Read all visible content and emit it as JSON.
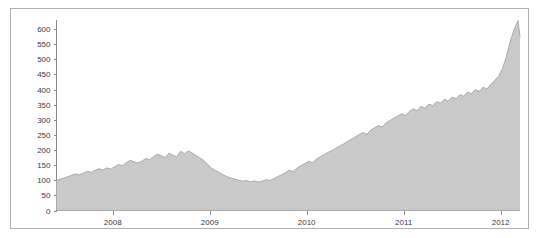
{
  "chart_data": {
    "type": "area",
    "title": "",
    "subtitle": "",
    "xlabel": "",
    "ylabel": "",
    "xlim": [
      2007.42,
      2012.2
    ],
    "ylim": [
      0,
      630
    ],
    "grid": false,
    "legend": null,
    "series_color": "#c9c9c9",
    "line_color": "#9d9d9d",
    "axis_color": "#8a8a8a",
    "border_color": "#b0b0b0",
    "yticks": [
      0,
      50,
      100,
      150,
      200,
      250,
      300,
      350,
      400,
      450,
      500,
      550,
      600
    ],
    "ytick_labels": [
      "0",
      "50",
      "100",
      "150",
      "200",
      "250",
      "300",
      "350",
      "400",
      "450",
      "500",
      "550",
      "600"
    ],
    "xticks": [
      2008,
      2009,
      2010,
      2011,
      2012
    ],
    "xtick_labels": [
      "2008",
      "2009",
      "2010",
      "2011",
      "2012"
    ],
    "x": [
      2007.42,
      2007.46,
      2007.5,
      2007.54,
      2007.58,
      2007.62,
      2007.66,
      2007.7,
      2007.74,
      2007.78,
      2007.82,
      2007.86,
      2007.9,
      2007.94,
      2007.98,
      2008.02,
      2008.06,
      2008.1,
      2008.14,
      2008.18,
      2008.22,
      2008.26,
      2008.3,
      2008.34,
      2008.38,
      2008.42,
      2008.46,
      2008.5,
      2008.54,
      2008.58,
      2008.62,
      2008.66,
      2008.7,
      2008.74,
      2008.78,
      2008.82,
      2008.86,
      2008.9,
      2008.94,
      2008.98,
      2009.02,
      2009.06,
      2009.1,
      2009.14,
      2009.18,
      2009.22,
      2009.26,
      2009.3,
      2009.34,
      2009.38,
      2009.42,
      2009.46,
      2009.5,
      2009.54,
      2009.58,
      2009.62,
      2009.66,
      2009.7,
      2009.74,
      2009.78,
      2009.82,
      2009.86,
      2009.9,
      2009.94,
      2009.98,
      2010.02,
      2010.06,
      2010.1,
      2010.14,
      2010.18,
      2010.22,
      2010.26,
      2010.3,
      2010.34,
      2010.38,
      2010.42,
      2010.46,
      2010.5,
      2010.54,
      2010.58,
      2010.62,
      2010.66,
      2010.7,
      2010.74,
      2010.78,
      2010.82,
      2010.86,
      2010.9,
      2010.94,
      2010.98,
      2011.02,
      2011.06,
      2011.1,
      2011.14,
      2011.18,
      2011.22,
      2011.26,
      2011.3,
      2011.34,
      2011.38,
      2011.42,
      2011.46,
      2011.5,
      2011.54,
      2011.58,
      2011.62,
      2011.66,
      2011.7,
      2011.74,
      2011.78,
      2011.82,
      2011.86,
      2011.9,
      2011.94,
      2011.98,
      2012.02,
      2012.06,
      2012.1,
      2012.14,
      2012.18,
      2012.2
    ],
    "values": [
      100,
      103,
      108,
      112,
      117,
      121,
      118,
      124,
      130,
      126,
      133,
      138,
      134,
      141,
      137,
      145,
      152,
      148,
      158,
      166,
      161,
      157,
      163,
      172,
      168,
      178,
      186,
      181,
      175,
      190,
      183,
      178,
      196,
      188,
      197,
      190,
      182,
      174,
      165,
      152,
      140,
      132,
      126,
      118,
      112,
      107,
      104,
      100,
      97,
      99,
      95,
      98,
      94,
      97,
      102,
      99,
      105,
      112,
      118,
      125,
      133,
      129,
      140,
      148,
      155,
      163,
      158,
      170,
      178,
      185,
      192,
      198,
      206,
      213,
      220,
      228,
      236,
      243,
      251,
      258,
      252,
      266,
      274,
      281,
      276,
      290,
      298,
      305,
      313,
      320,
      314,
      328,
      336,
      330,
      345,
      338,
      352,
      347,
      360,
      355,
      368,
      362,
      375,
      370,
      383,
      378,
      392,
      386,
      400,
      394,
      408,
      402,
      418,
      430,
      445,
      470,
      510,
      560,
      600,
      628,
      575
    ]
  }
}
